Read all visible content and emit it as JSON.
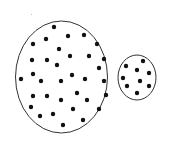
{
  "diagram": {
    "background": "#ffffff",
    "stroke_color": "#333333",
    "dot_color": "#111111",
    "dot_radius": 2.2,
    "groups": [
      {
        "name": "large-group",
        "ellipse": {
          "cx": 61.5,
          "cy": 77,
          "rx": 46,
          "ry": 56
        },
        "dot_count": 34,
        "dots": [
          [
            54,
            27
          ],
          [
            68,
            36
          ],
          [
            84,
            35
          ],
          [
            46,
            39
          ],
          [
            33,
            44
          ],
          [
            97,
            44
          ],
          [
            59,
            49
          ],
          [
            32,
            60
          ],
          [
            47,
            60
          ],
          [
            70,
            56
          ],
          [
            89,
            56
          ],
          [
            104,
            59
          ],
          [
            57,
            65
          ],
          [
            99,
            68
          ],
          [
            33,
            74
          ],
          [
            72,
            75
          ],
          [
            21,
            79
          ],
          [
            41,
            81
          ],
          [
            61,
            81
          ],
          [
            85,
            79
          ],
          [
            104,
            81
          ],
          [
            33,
            96
          ],
          [
            47,
            96
          ],
          [
            77,
            93
          ],
          [
            106,
            95
          ],
          [
            61,
            100
          ],
          [
            87,
            100
          ],
          [
            31,
            107
          ],
          [
            73,
            109
          ],
          [
            99,
            109
          ],
          [
            40,
            116
          ],
          [
            53,
            114
          ],
          [
            83,
            120
          ],
          [
            63,
            125
          ]
        ]
      },
      {
        "name": "small-group",
        "ellipse": {
          "cx": 137,
          "cy": 77.5,
          "rx": 19,
          "ry": 22.5
        },
        "dot_count": 9,
        "dots": [
          [
            126,
            66
          ],
          [
            143,
            61
          ],
          [
            137,
            70
          ],
          [
            149,
            73
          ],
          [
            123,
            78
          ],
          [
            140,
            81
          ],
          [
            127,
            86
          ],
          [
            149,
            86
          ],
          [
            137,
            93
          ]
        ]
      }
    ],
    "speck": {
      "x": 31,
      "y": 14
    }
  }
}
